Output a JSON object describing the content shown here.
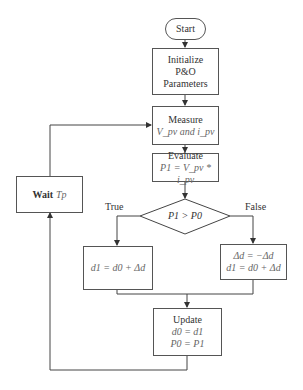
{
  "diagram": {
    "type": "flowchart",
    "nodes": {
      "start": {
        "label": "Start"
      },
      "init": {
        "line1": "Initialize",
        "line2": "P&O",
        "line3": "Parameters"
      },
      "measure": {
        "line1": "Measure",
        "line2": "V_pv and i_pv"
      },
      "evaluate": {
        "line1": "Evaluate",
        "line2": "P1 = V_pv * i_pv"
      },
      "decision": {
        "label": "P1 > P0"
      },
      "true_branch": {
        "line1": "d1 = d0 + Δd"
      },
      "false_branch": {
        "line1": "Δd = −Δd",
        "line2": "d1 = d0 + Δd"
      },
      "update": {
        "line1": "Update",
        "line2": "d0 = d1",
        "line3": "P0 = P1"
      },
      "wait": {
        "bold": "Wait",
        "math": "Tp"
      }
    },
    "edge_labels": {
      "true": "True",
      "false": "False"
    },
    "edges": [
      [
        "start",
        "init"
      ],
      [
        "init",
        "measure"
      ],
      [
        "measure",
        "evaluate"
      ],
      [
        "evaluate",
        "decision"
      ],
      [
        "decision",
        "true_branch",
        "True"
      ],
      [
        "decision",
        "false_branch",
        "False"
      ],
      [
        "true_branch",
        "update"
      ],
      [
        "false_branch",
        "update"
      ],
      [
        "update",
        "wait"
      ],
      [
        "wait",
        "measure"
      ]
    ]
  }
}
